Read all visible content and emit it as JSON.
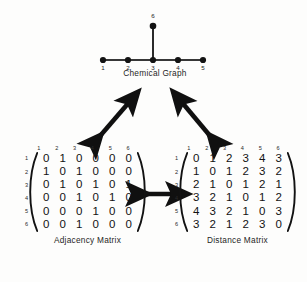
{
  "figure": {
    "background_color": "#fdfdfc",
    "ink_color": "#121212"
  },
  "graph": {
    "caption": "Chemical Graph",
    "vertices": [
      {
        "id": "1",
        "x": 8,
        "y": 52
      },
      {
        "id": "2",
        "x": 33,
        "y": 52
      },
      {
        "id": "3",
        "x": 58,
        "y": 52
      },
      {
        "id": "4",
        "x": 83,
        "y": 52
      },
      {
        "id": "5",
        "x": 108,
        "y": 52
      },
      {
        "id": "6",
        "x": 58,
        "y": 18
      }
    ],
    "edges": [
      {
        "from": "1",
        "to": "2"
      },
      {
        "from": "2",
        "to": "3"
      },
      {
        "from": "3",
        "to": "4"
      },
      {
        "from": "4",
        "to": "5"
      },
      {
        "from": "3",
        "to": "6"
      }
    ],
    "vertex_labels": [
      "1",
      "2",
      "3",
      "4",
      "5",
      "6"
    ]
  },
  "adjacency": {
    "caption": "Adjacency Matrix",
    "col_headers": [
      "1",
      "2",
      "3",
      "4",
      "5",
      "6"
    ],
    "row_labels": [
      "1",
      "2",
      "3",
      "4",
      "5",
      "6"
    ],
    "rows": [
      [
        "0",
        "1",
        "0",
        "0",
        "0",
        "0"
      ],
      [
        "1",
        "0",
        "1",
        "0",
        "0",
        "0"
      ],
      [
        "0",
        "1",
        "0",
        "1",
        "0",
        "1"
      ],
      [
        "0",
        "0",
        "1",
        "0",
        "1",
        "0"
      ],
      [
        "0",
        "0",
        "0",
        "1",
        "0",
        "0"
      ],
      [
        "0",
        "0",
        "1",
        "0",
        "0",
        "0"
      ]
    ]
  },
  "distance": {
    "caption": "Distance Matrix",
    "col_headers": [
      "1",
      "2",
      "3",
      "4",
      "5",
      "6"
    ],
    "row_labels": [
      "1",
      "2",
      "3",
      "4",
      "5",
      "6"
    ],
    "rows": [
      [
        "0",
        "1",
        "2",
        "3",
        "4",
        "3"
      ],
      [
        "1",
        "0",
        "1",
        "2",
        "3",
        "2"
      ],
      [
        "2",
        "1",
        "0",
        "1",
        "2",
        "1"
      ],
      [
        "3",
        "2",
        "1",
        "0",
        "1",
        "2"
      ],
      [
        "4",
        "3",
        "2",
        "1",
        "0",
        "3"
      ],
      [
        "3",
        "2",
        "1",
        "2",
        "3",
        "0"
      ]
    ]
  },
  "arrows": [
    {
      "name": "graph-to-adjacency",
      "direction": "bidirectional",
      "orientation": "diagonal-up-right"
    },
    {
      "name": "graph-to-distance",
      "direction": "bidirectional",
      "orientation": "diagonal-up-left"
    },
    {
      "name": "adjacency-to-distance",
      "direction": "bidirectional",
      "orientation": "horizontal"
    }
  ]
}
